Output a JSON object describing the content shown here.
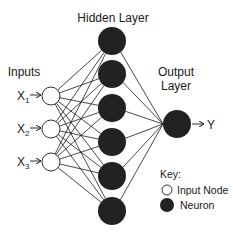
{
  "labels": {
    "hidden_layer": "Hidden Layer",
    "inputs": "Inputs",
    "output_layer_line1": "Output",
    "output_layer_line2": "Layer",
    "output_symbol": "Y"
  },
  "inputs": [
    {
      "symbol": "X",
      "subscript": "1",
      "cx": 51,
      "cy": 96
    },
    {
      "symbol": "X",
      "subscript": "2",
      "cx": 51,
      "cy": 129
    },
    {
      "symbol": "X",
      "subscript": "3",
      "cx": 51,
      "cy": 162
    }
  ],
  "hidden_nodes": [
    {
      "cx": 112,
      "cy": 41
    },
    {
      "cx": 112,
      "cy": 74
    },
    {
      "cx": 112,
      "cy": 108
    },
    {
      "cx": 112,
      "cy": 142
    },
    {
      "cx": 112,
      "cy": 176
    },
    {
      "cx": 112,
      "cy": 211
    }
  ],
  "output_node": {
    "cx": 177,
    "cy": 124
  },
  "key": {
    "title": "Key:",
    "items": [
      {
        "label": "Input Node",
        "style": "open-circle"
      },
      {
        "label": "Neuron",
        "style": "filled-circle"
      }
    ]
  },
  "colors": {
    "neuron_fill": "#222222",
    "input_fill": "#ffffff",
    "line": "#1a1a1a",
    "background": "#ffffff"
  }
}
